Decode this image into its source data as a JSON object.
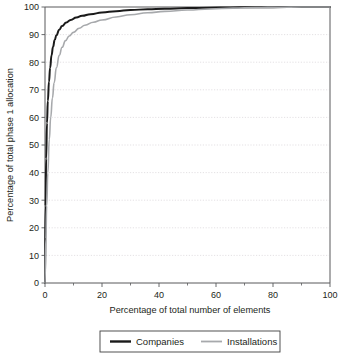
{
  "chart_data": {
    "type": "line",
    "title": "",
    "xlabel": "Percentage of total number of elements",
    "ylabel": "Percentage of total phase 1 allocation",
    "xlim": [
      0,
      100
    ],
    "ylim": [
      0,
      100
    ],
    "grid": true,
    "grid_axis": "y",
    "legend_position": "bottom",
    "x_ticks": [
      0,
      20,
      40,
      60,
      80,
      100
    ],
    "x_tick_labels": [
      "0",
      "20",
      "40",
      "60",
      "80",
      "100"
    ],
    "x_minor_ticks": [
      10,
      30,
      50,
      70,
      90
    ],
    "y_ticks": [
      0,
      10,
      20,
      30,
      40,
      50,
      60,
      70,
      80,
      90,
      100
    ],
    "y_tick_labels": [
      "0",
      "10",
      "20",
      "30",
      "40",
      "50",
      "60",
      "70",
      "80",
      "90",
      "100"
    ],
    "series": [
      {
        "name": "Companies",
        "color": "#1a1a1a",
        "width": 2.0,
        "x": [
          0,
          0.2,
          0.4,
          0.7,
          1.0,
          1.4,
          1.8,
          2.3,
          2.8,
          3.4,
          4.0,
          5.0,
          6.0,
          7.5,
          9.0,
          11.0,
          13.0,
          16.0,
          20.0,
          25.0,
          30.0,
          36.0,
          42.0,
          50.0,
          58.0,
          65.0,
          72.0,
          80.0,
          90.0,
          100.0
        ],
        "y": [
          0,
          28.0,
          45.0,
          58.0,
          66.0,
          73.0,
          78.0,
          82.5,
          85.5,
          88.0,
          89.8,
          91.8,
          93.1,
          94.4,
          95.3,
          96.2,
          96.8,
          97.4,
          98.0,
          98.5,
          98.9,
          99.2,
          99.4,
          99.6,
          99.75,
          99.85,
          99.9,
          99.95,
          99.99,
          100.0
        ]
      },
      {
        "name": "Installations",
        "color": "#a7a9ac",
        "width": 1.6,
        "x": [
          0,
          0.3,
          0.6,
          1.0,
          1.5,
          2.0,
          2.6,
          3.2,
          4.0,
          5.0,
          6.0,
          7.2,
          8.5,
          10.0,
          12.0,
          14.0,
          17.0,
          20.0,
          25.0,
          30.0,
          36.0,
          42.0,
          50.0,
          58.0,
          66.0,
          74.0,
          82.0,
          90.0,
          100.0
        ],
        "y": [
          0,
          16.0,
          28.0,
          40.0,
          52.0,
          60.0,
          67.0,
          72.5,
          78.0,
          82.5,
          85.4,
          87.8,
          89.5,
          90.8,
          92.3,
          93.4,
          94.5,
          95.3,
          96.4,
          97.2,
          97.9,
          98.4,
          98.9,
          99.3,
          99.6,
          99.8,
          99.92,
          99.98,
          100.0
        ]
      }
    ]
  },
  "legend": {
    "entries": [
      {
        "label": "Companies"
      },
      {
        "label": "Installations"
      }
    ]
  }
}
